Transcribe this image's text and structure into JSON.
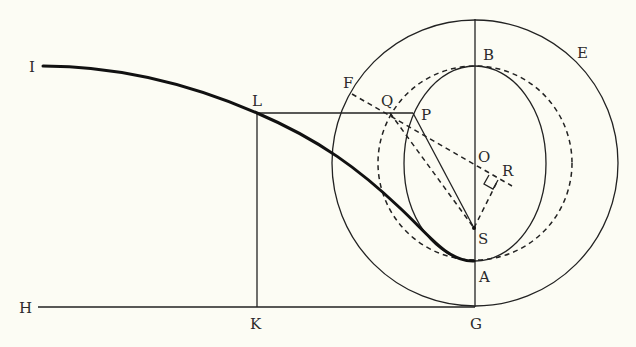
{
  "figure": {
    "type": "geometric-construction",
    "labels": {
      "I": "I",
      "L": "L",
      "H": "H",
      "K": "K",
      "G": "G",
      "A": "A",
      "S": "S",
      "O": "O",
      "R": "R",
      "P": "P",
      "Q": "Q",
      "F": "F",
      "B": "B",
      "E": "E"
    },
    "elements": [
      "curve I-L-A (bold)",
      "outer circle E centered O",
      "dashed circle centered O through B and A",
      "ellipse with vertices B and A",
      "vertical line G-A-S-O-B",
      "horizontal line H-K-G",
      "line L-K",
      "line L-Q-P",
      "line P-S",
      "dashed line F-Q-O-R",
      "dashed line Q-S",
      "dashed line S-R with right angle at R"
    ]
  }
}
